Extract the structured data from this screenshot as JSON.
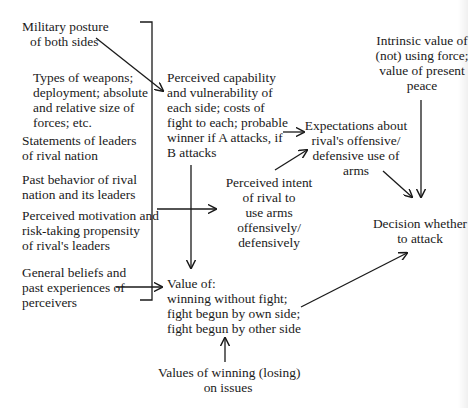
{
  "diagram": {
    "inputs": [
      {
        "id": "military-posture",
        "lines": [
          "Military posture",
          "of both sides"
        ]
      },
      {
        "id": "weapons",
        "lines": [
          "Types of weapons;",
          "deployment; absolute",
          "and relative size of",
          "forces; etc."
        ]
      },
      {
        "id": "statements",
        "lines": [
          "Statements of leaders",
          "of rival nation"
        ]
      },
      {
        "id": "past-behavior",
        "lines": [
          "Past behavior of rival",
          "nation and its leaders"
        ]
      },
      {
        "id": "motivation",
        "lines": [
          "Perceived motivation and",
          "risk-taking propensity",
          "of rival's leaders"
        ]
      },
      {
        "id": "beliefs",
        "lines": [
          "General beliefs and",
          "past experiences of",
          "perceivers"
        ]
      }
    ],
    "nodes": {
      "capability": {
        "lines": [
          "Perceived capability",
          "and vulnerability of",
          "each side; costs of",
          "fight to each; probable",
          "winner if A attacks, if",
          "B attacks"
        ]
      },
      "intent": {
        "lines": [
          "Perceived intent",
          "of rival to",
          "use arms",
          "offensively/",
          "defensively"
        ]
      },
      "expectations": {
        "lines": [
          "Expectations about",
          "rival's offensive/",
          "defensive use of",
          "arms"
        ]
      },
      "intrinsic": {
        "lines": [
          "Intrinsic value of",
          "(not) using force;",
          "value of present",
          "peace"
        ]
      },
      "decision": {
        "lines": [
          "Decision whether",
          "to attack"
        ]
      },
      "value": {
        "lines": [
          "Value of:",
          "winning without fight;",
          "fight begun by own side;",
          "fight begun by other side"
        ]
      },
      "issues": {
        "lines": [
          "Values of winning (losing)",
          "on issues"
        ]
      }
    },
    "colors": {
      "ink": "#1a1a1a",
      "background": "#ffffff"
    }
  }
}
